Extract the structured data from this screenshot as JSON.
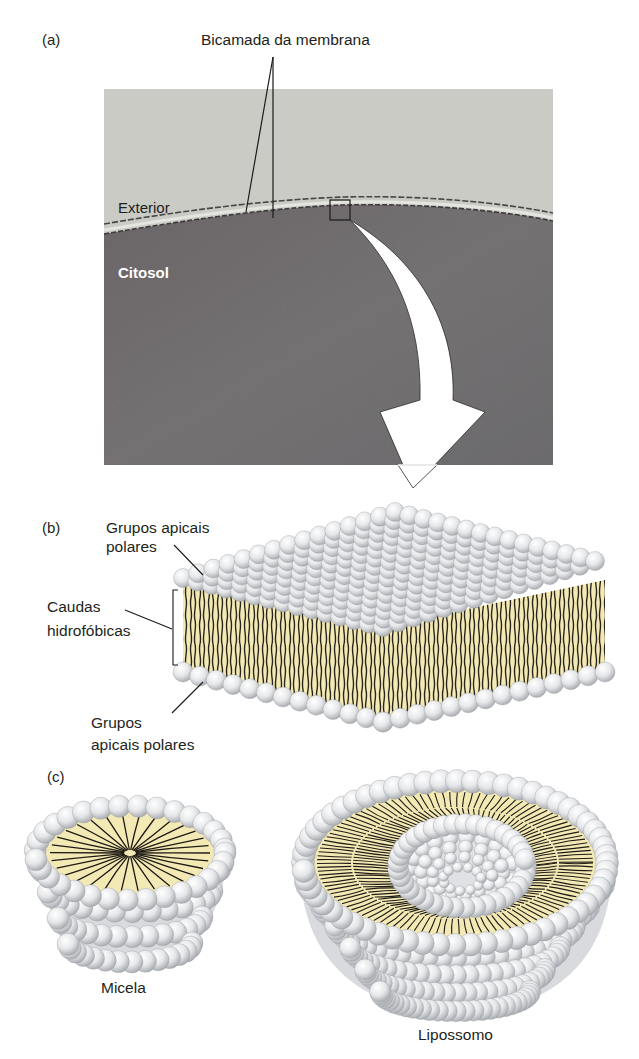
{
  "panels": {
    "a": {
      "label": "(a)",
      "title": "Bicamada da membrana",
      "exterior_label": "Exterior",
      "cytosol_label": "Citosol"
    },
    "b": {
      "label": "(b)",
      "top_heads_label_line1": "Grupos apicais",
      "top_heads_label_line2": "polares",
      "tails_label_line1": "Caudas",
      "tails_label_line2": "hidrofóbicas",
      "bottom_heads_label_line1": "Grupos",
      "bottom_heads_label_line2": "apicais polares"
    },
    "c": {
      "label": "(c)",
      "micelle_label": "Micela",
      "liposome_label": "Lipossomo"
    }
  },
  "colors": {
    "tail_fill": "#f3e9b5",
    "head_light": "#ffffff",
    "head_shadow": "#b9bcc0",
    "tail_line": "#1e1a14",
    "photo_exterior": "#c9c9c4",
    "photo_cytosol": "#6d6a6b"
  }
}
